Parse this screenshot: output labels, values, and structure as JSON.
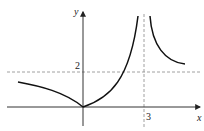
{
  "figure": {
    "type": "function-graph",
    "axes": {
      "x_label": "x",
      "y_label": "y"
    },
    "tick_labels": {
      "y_value": "2",
      "x_value": "3"
    },
    "asymptotes": [
      {
        "kind": "horizontal",
        "value": "y = 2",
        "style": "dashed"
      },
      {
        "kind": "vertical",
        "value": "x = 3",
        "style": "dashed"
      }
    ],
    "curve_description": [
      "Decreasing curve from left approaching origin (cusp at origin)",
      "Increasing curve from origin rising to +infinity as x approaches 3 from the left",
      "Decreasing curve from +infinity right of x = 3 approaching y = 2"
    ],
    "colors": {
      "curve": "#111111",
      "axis": "#333333",
      "dashed": "#888888"
    }
  }
}
